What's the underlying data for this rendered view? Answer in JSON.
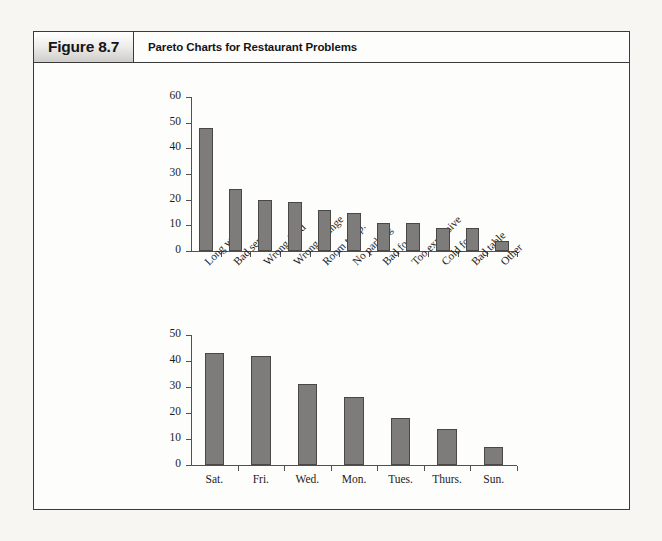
{
  "figure": {
    "number_label": "Figure 8.7",
    "title": "Pareto Charts for Restaurant Problems"
  },
  "chart_data": [
    {
      "type": "bar",
      "title": "",
      "xlabel": "",
      "ylabel": "",
      "ylim": [
        0,
        60
      ],
      "yticks": [
        0,
        10,
        20,
        30,
        40,
        50,
        60
      ],
      "grid": false,
      "legend": "none",
      "bar_color": "#7e7c7a",
      "categories": [
        "Long wait",
        "Bad server",
        "Wrong food",
        "Wrong change",
        "Room temp.",
        "No parking",
        "Bad food",
        "Too expensive",
        "Cold food",
        "Bad table",
        "Other"
      ],
      "values": [
        48,
        24,
        20,
        19,
        16,
        15,
        11,
        11,
        9,
        9,
        4
      ]
    },
    {
      "type": "bar",
      "title": "",
      "xlabel": "",
      "ylabel": "",
      "ylim": [
        0,
        50
      ],
      "yticks": [
        0,
        10,
        20,
        30,
        40,
        50
      ],
      "grid": false,
      "legend": "none",
      "bar_color": "#7e7c7a",
      "categories": [
        "Sat.",
        "Fri.",
        "Wed.",
        "Mon.",
        "Tues.",
        "Thurs.",
        "Sun."
      ],
      "values": [
        43,
        42,
        31,
        26,
        18,
        14,
        7
      ]
    }
  ]
}
